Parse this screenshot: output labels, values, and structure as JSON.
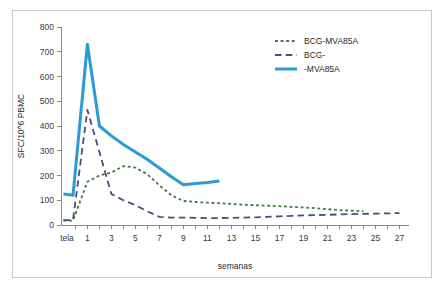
{
  "chart_data": {
    "type": "line",
    "title": "",
    "subtitle": "",
    "xlabel": "semanas",
    "ylabel": "SFC/10^6 PBMC",
    "ylim": [
      0,
      800
    ],
    "yticks": [
      0,
      100,
      200,
      300,
      400,
      500,
      600,
      700,
      800
    ],
    "xlim": [
      -1.2,
      27.8
    ],
    "xticks": [
      1,
      3,
      5,
      7,
      9,
      11,
      13,
      15,
      17,
      19,
      21,
      23,
      25,
      27
    ],
    "xtick_labels": [
      "1",
      "3",
      "5",
      "7",
      "9",
      "11",
      "13",
      "15",
      "17",
      "19",
      "21",
      "23",
      "25",
      "27"
    ],
    "x_origin_label": "tela",
    "grid": false,
    "legend_position": "top-right",
    "series": [
      {
        "name": "BCG-MVA85A",
        "color": "#3f7a3f",
        "linestyle": "dotted",
        "linewidth": 1.8,
        "x": [
          -1.0,
          -0.2,
          1,
          2,
          3,
          4,
          5,
          6,
          7,
          8,
          9,
          10,
          11,
          12,
          13,
          14,
          15,
          16,
          17,
          18,
          19,
          20,
          21,
          22,
          23,
          24
        ],
        "y": [
          18,
          18,
          175,
          200,
          212,
          238,
          232,
          205,
          160,
          120,
          97,
          93,
          90,
          88,
          85,
          82,
          80,
          78,
          76,
          73,
          71,
          68,
          64,
          60,
          58,
          56
        ]
      },
      {
        "name": "BCG-",
        "color": "#4c4c7a",
        "linestyle": "dashed",
        "linewidth": 1.8,
        "x": [
          -1.0,
          -0.2,
          1,
          2,
          3,
          4,
          5,
          6,
          7,
          8,
          9,
          10,
          11,
          12,
          13,
          14,
          15,
          16,
          17,
          18,
          19,
          20,
          21,
          22,
          23,
          24,
          25,
          26,
          27
        ],
        "y": [
          20,
          20,
          465,
          295,
          125,
          100,
          80,
          55,
          33,
          30,
          30,
          29,
          28,
          28,
          29,
          30,
          31,
          33,
          35,
          37,
          39,
          40,
          41,
          43,
          44,
          45,
          46,
          47,
          48
        ]
      },
      {
        "name": "-MVA85A",
        "color": "#2a9bd4",
        "linestyle": "solid",
        "linewidth": 3.0,
        "x": [
          -1.0,
          -0.2,
          1,
          2,
          3,
          4,
          5,
          6,
          7,
          8,
          9,
          10,
          11,
          12
        ],
        "y": [
          125,
          120,
          730,
          400,
          360,
          325,
          295,
          265,
          230,
          195,
          163,
          168,
          172,
          178
        ]
      }
    ],
    "legend": [
      {
        "label": "BCG-MVA85A",
        "color": "#3f7a3f",
        "linestyle": "dotted"
      },
      {
        "label": "BCG-",
        "color": "#4c4c7a",
        "linestyle": "dashed"
      },
      {
        "label": "-MVA85A",
        "color": "#2a9bd4",
        "linestyle": "solid"
      }
    ]
  }
}
